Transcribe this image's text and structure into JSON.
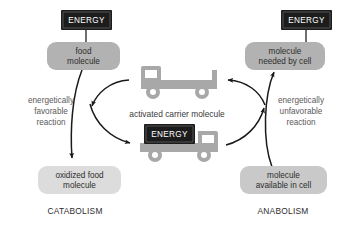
{
  "diagram": {
    "colors": {
      "background": "#ffffff",
      "energy_box_fill": "#1c1c1c",
      "energy_box_text": "#ffffff",
      "pill_dark_fill": "#b0b0b0",
      "pill_light_fill": "#dcdcdc",
      "truck_fill": "#a8a8a8",
      "arrow_stroke": "#1a1a1a",
      "label_text": "#5a5a5a"
    },
    "energy_boxes": [
      {
        "id": "energy-top-left",
        "label": "ENERGY"
      },
      {
        "id": "energy-top-right",
        "label": "ENERGY"
      },
      {
        "id": "energy-on-truck",
        "label": "ENERGY"
      }
    ],
    "nodes": {
      "food_molecule": {
        "line1": "food",
        "line2": "molecule"
      },
      "oxidized_food_molecule": {
        "line1": "oxidized food",
        "line2": "molecule"
      },
      "molecule_needed_by_cell": {
        "line1": "molecule",
        "line2": "needed by cell"
      },
      "molecule_available_in_cell": {
        "line1": "molecule",
        "line2": "available in cell"
      }
    },
    "reaction_labels": {
      "left": {
        "line1": "energetically",
        "line2": "favorable",
        "line3": "reaction"
      },
      "right": {
        "line1": "energetically",
        "line2": "unfavorable",
        "line3": "reaction"
      }
    },
    "center_label": "activated carrier molecule",
    "sections": {
      "left": "CATABOLISM",
      "right": "ANABOLISM"
    },
    "trucks": [
      {
        "id": "empty-carrier-truck",
        "direction": "facing-left",
        "loaded": false
      },
      {
        "id": "loaded-carrier-truck",
        "direction": "facing-right",
        "loaded": true
      }
    ]
  }
}
